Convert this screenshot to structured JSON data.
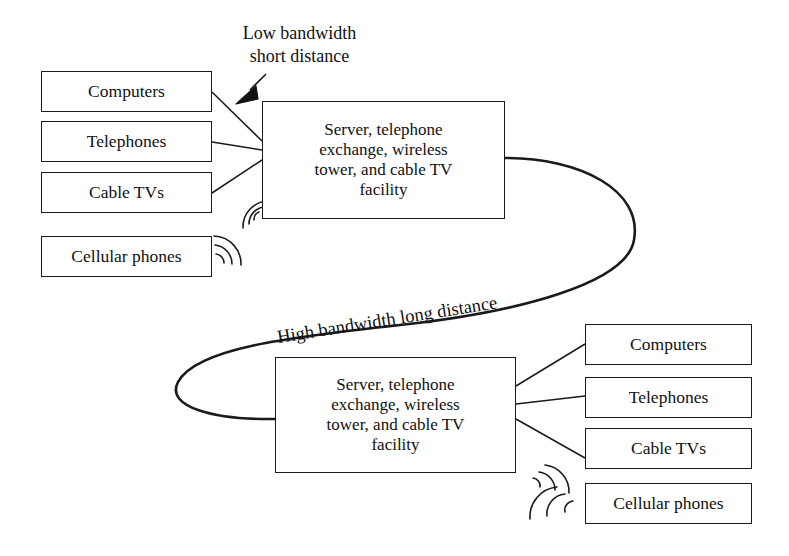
{
  "diagram": {
    "background_color": "#ffffff",
    "line_color": "#1a1a1a",
    "text_color": "#111111"
  },
  "labels": {
    "low_bandwidth": "Low bandwidth\nshort distance",
    "high_bandwidth": "High bandwidth long distance"
  },
  "hubs": {
    "top": {
      "line1": "Server, telephone",
      "line2": "exchange, wireless",
      "line3": "tower, and cable TV",
      "line4": "facility"
    },
    "bottom": {
      "line1": "Server, telephone",
      "line2": "exchange, wireless",
      "line3": "tower, and cable TV",
      "line4": "facility"
    }
  },
  "left_endpoints": [
    {
      "label": "Computers"
    },
    {
      "label": "Telephones"
    },
    {
      "label": "Cable TVs"
    },
    {
      "label": "Cellular phones"
    }
  ],
  "right_endpoints": [
    {
      "label": "Computers"
    },
    {
      "label": "Telephones"
    },
    {
      "label": "Cable TVs"
    },
    {
      "label": "Cellular phones"
    }
  ],
  "icons": {
    "arrow": "arrow-pointer-icon",
    "wireless_top_hub": "wireless-signal-icon",
    "wireless_top_phone": "wireless-signal-icon",
    "wireless_bottom_hub": "wireless-signal-icon",
    "wireless_bottom_phone": "wireless-signal-icon"
  }
}
